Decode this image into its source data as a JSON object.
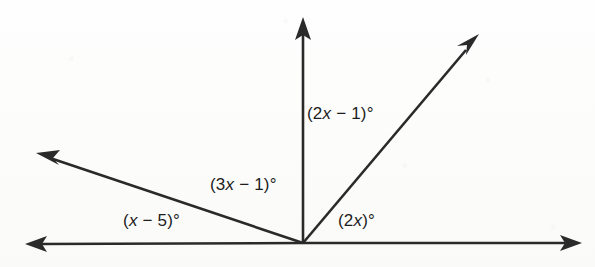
{
  "figure": {
    "kind": "angle-diagram",
    "background_color": "#fdfdfc",
    "stroke_color": "#2a2a2a",
    "text_color": "#1d1d1d",
    "vertex": {
      "x": 303,
      "y": 243
    },
    "rays": [
      {
        "name": "ray-left-horizontal",
        "to_x": 27,
        "to_y": 244,
        "arrow": true
      },
      {
        "name": "ray-right-horizontal",
        "to_x": 580,
        "to_y": 243,
        "arrow": true
      },
      {
        "name": "ray-upper-left",
        "to_x": 38,
        "to_y": 154,
        "arrow": true
      },
      {
        "name": "ray-vertical",
        "to_x": 303,
        "to_y": 19,
        "arrow": true
      },
      {
        "name": "ray-upper-right",
        "to_x": 478,
        "to_y": 36,
        "arrow": true
      }
    ],
    "labels": {
      "upper_right_angle": {
        "prefix": "(2",
        "var": "x",
        "suffix": " − 1)°",
        "text": "(2x − 1)°",
        "x": 307,
        "y": 104
      },
      "middle_angle": {
        "prefix": "(3",
        "var": "x",
        "suffix": " − 1)°",
        "text": "(3x − 1)°",
        "x": 210,
        "y": 175
      },
      "left_angle": {
        "prefix": "(",
        "var": "x",
        "suffix": " − 5)°",
        "text": "(x − 5)°",
        "x": 123,
        "y": 211
      },
      "right_angle": {
        "prefix": "(2",
        "var": "x",
        "suffix": ")°",
        "text": "(2x)°",
        "x": 338,
        "y": 211
      }
    }
  }
}
